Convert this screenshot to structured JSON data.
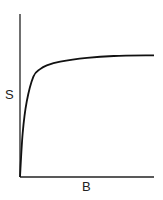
{
  "chart_data": {
    "type": "line",
    "title": "",
    "xlabel": "B",
    "ylabel": "S",
    "xticks": [],
    "yticks": [],
    "grid": false,
    "legend": null,
    "series": [
      {
        "name": "S vs B (saturation curve)",
        "description": "Rapid rise from origin then plateau (hyperbolic/saturating)",
        "x": [
          0,
          0.02,
          0.05,
          0.1,
          0.15,
          0.2,
          0.3,
          0.5,
          0.7,
          1.0
        ],
        "y": [
          0.0,
          0.35,
          0.6,
          0.8,
          0.86,
          0.89,
          0.92,
          0.95,
          0.965,
          0.97
        ]
      }
    ],
    "xlim": [
      0,
      1
    ],
    "ylim": [
      0,
      1.3
    ]
  },
  "colors": {
    "axis": "#222222",
    "curve": "#111111",
    "background": "#ffffff"
  }
}
